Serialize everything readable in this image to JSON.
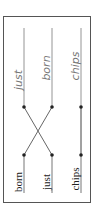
{
  "diagram": {
    "type": "word-alignment",
    "orientation": "rotated-90-ccw",
    "colors": {
      "frame": "#555555",
      "line": "#777777",
      "dot": "#222222",
      "source_text": "#222222",
      "target_text": "#777777"
    },
    "source_words": [
      {
        "text": "born"
      },
      {
        "text": "just"
      },
      {
        "text": "chips"
      }
    ],
    "target_words": [
      {
        "text": "just"
      },
      {
        "text": "born"
      },
      {
        "text": "chips"
      }
    ],
    "alignments": [
      {
        "source": 0,
        "target": 1
      },
      {
        "source": 1,
        "target": 0
      },
      {
        "source": 2,
        "target": 2
      }
    ]
  }
}
